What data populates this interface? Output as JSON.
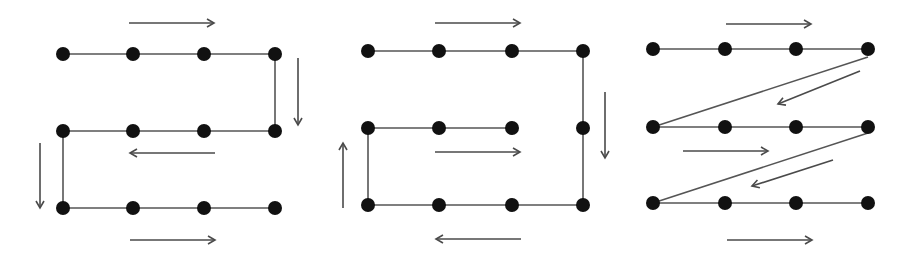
{
  "colors": {
    "background": "#ffffff",
    "node": "#111111",
    "edge": "#555555",
    "arrow": "#4a4a4a"
  },
  "node_radius": 7,
  "diagrams": [
    {
      "id": "serpentine-path",
      "nodes": [
        [
          63,
          54
        ],
        [
          133,
          54
        ],
        [
          204,
          54
        ],
        [
          275,
          54
        ],
        [
          63,
          131
        ],
        [
          133,
          131
        ],
        [
          204,
          131
        ],
        [
          275,
          131
        ],
        [
          63,
          208
        ],
        [
          133,
          208
        ],
        [
          204,
          208
        ],
        [
          275,
          208
        ]
      ],
      "edges": [
        [
          63,
          54,
          275,
          54
        ],
        [
          275,
          54,
          275,
          131
        ],
        [
          63,
          131,
          275,
          131
        ],
        [
          63,
          131,
          63,
          208
        ],
        [
          63,
          208,
          275,
          208
        ]
      ],
      "arrows": [
        {
          "dir": "right",
          "from": [
            129,
            23
          ],
          "to": [
            214,
            23
          ]
        },
        {
          "dir": "down",
          "from": [
            298,
            58
          ],
          "to": [
            298,
            125
          ]
        },
        {
          "dir": "left",
          "from": [
            215,
            153
          ],
          "to": [
            130,
            153
          ]
        },
        {
          "dir": "down",
          "from": [
            40,
            143
          ],
          "to": [
            40,
            208
          ]
        },
        {
          "dir": "right",
          "from": [
            130,
            240
          ],
          "to": [
            215,
            240
          ]
        }
      ]
    },
    {
      "id": "spiral-path",
      "nodes": [
        [
          368,
          51
        ],
        [
          439,
          51
        ],
        [
          512,
          51
        ],
        [
          583,
          51
        ],
        [
          368,
          128
        ],
        [
          439,
          128
        ],
        [
          512,
          128
        ],
        [
          583,
          128
        ],
        [
          368,
          205
        ],
        [
          439,
          205
        ],
        [
          512,
          205
        ],
        [
          583,
          205
        ]
      ],
      "edges": [
        [
          368,
          51,
          583,
          51
        ],
        [
          583,
          51,
          583,
          205
        ],
        [
          368,
          205,
          583,
          205
        ],
        [
          368,
          205,
          368,
          128
        ],
        [
          368,
          128,
          512,
          128
        ]
      ],
      "arrows": [
        {
          "dir": "right",
          "from": [
            435,
            23
          ],
          "to": [
            520,
            23
          ]
        },
        {
          "dir": "down",
          "from": [
            605,
            92
          ],
          "to": [
            605,
            158
          ]
        },
        {
          "dir": "left",
          "from": [
            521,
            239
          ],
          "to": [
            436,
            239
          ]
        },
        {
          "dir": "up",
          "from": [
            343,
            208
          ],
          "to": [
            343,
            143
          ]
        },
        {
          "dir": "right",
          "from": [
            435,
            152
          ],
          "to": [
            520,
            152
          ]
        }
      ]
    },
    {
      "id": "zigzag-raster-path",
      "nodes": [
        [
          653,
          49
        ],
        [
          725,
          49
        ],
        [
          796,
          49
        ],
        [
          868,
          49
        ],
        [
          653,
          127
        ],
        [
          725,
          127
        ],
        [
          796,
          127
        ],
        [
          868,
          127
        ],
        [
          653,
          203
        ],
        [
          725,
          203
        ],
        [
          796,
          203
        ],
        [
          868,
          203
        ]
      ],
      "edges": [
        [
          653,
          49,
          868,
          49
        ],
        [
          868,
          57,
          653,
          127
        ],
        [
          653,
          127,
          868,
          127
        ],
        [
          868,
          133,
          653,
          203
        ],
        [
          653,
          203,
          868,
          203
        ]
      ],
      "arrows": [
        {
          "dir": "right",
          "from": [
            726,
            24
          ],
          "to": [
            811,
            24
          ]
        },
        {
          "dir": "down-left",
          "from": [
            860,
            71
          ],
          "to": [
            778,
            104
          ]
        },
        {
          "dir": "right",
          "from": [
            683,
            151
          ],
          "to": [
            768,
            151
          ]
        },
        {
          "dir": "down-left",
          "from": [
            833,
            160
          ],
          "to": [
            752,
            186
          ]
        },
        {
          "dir": "right",
          "from": [
            727,
            240
          ],
          "to": [
            812,
            240
          ]
        }
      ]
    }
  ]
}
